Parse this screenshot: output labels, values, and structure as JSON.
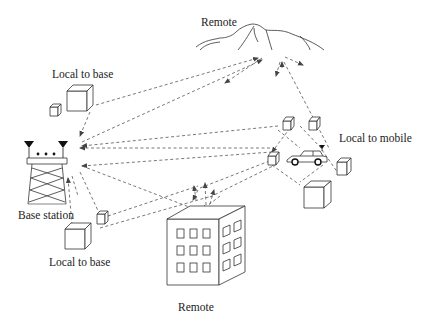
{
  "diagram": {
    "labels": {
      "remote_top": "Remote",
      "local_to_base_top": "Local to base",
      "local_to_mobile": "Local to mobile",
      "base_station": "Base station",
      "local_to_base_bottom": "Local to base",
      "remote_bottom": "Remote"
    },
    "nodes": [
      {
        "id": "base_station",
        "type": "tower",
        "label": "Base station"
      },
      {
        "id": "mountain",
        "type": "terrain",
        "label": "Remote"
      },
      {
        "id": "building",
        "type": "building",
        "label": "Remote"
      },
      {
        "id": "car",
        "type": "mobile",
        "label": "Local to mobile"
      },
      {
        "id": "scatterers_base_top",
        "type": "cube-group",
        "label": "Local to base"
      },
      {
        "id": "scatterers_base_bottom",
        "type": "cube-group",
        "label": "Local to base"
      },
      {
        "id": "scatterers_mobile",
        "type": "cube-group",
        "label": "Local to mobile"
      }
    ],
    "line_style": "dashed arrows",
    "colors": {
      "stroke": "#333333",
      "ray": "#555555",
      "background": "#ffffff"
    }
  }
}
